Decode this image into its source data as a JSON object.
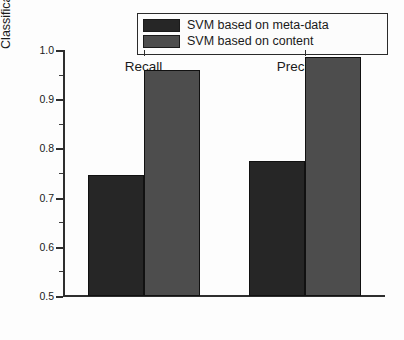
{
  "chart_data": {
    "type": "bar",
    "title": "",
    "subtitle": "",
    "xlabel": "",
    "ylabel": "Classification Accuracy",
    "categories": [
      "Recall",
      "Precision"
    ],
    "series": [
      {
        "name": "SVM based on meta-data",
        "color": "#262626",
        "values": [
          0.745,
          0.775
        ]
      },
      {
        "name": "SVM based on content",
        "color": "#4d4d4d",
        "values": [
          0.96,
          0.985
        ]
      }
    ],
    "ylim": [
      0.5,
      1.0
    ],
    "ytick_labels": [
      "0.5",
      "0.6",
      "0.7",
      "0.8",
      "0.9",
      "1.0"
    ],
    "ytick_values": [
      0.5,
      0.6,
      0.7,
      0.8,
      0.9,
      1.0
    ],
    "yminor_values": [
      0.55,
      0.65,
      0.75,
      0.85,
      0.95
    ],
    "grid": false,
    "legend_position": "top-center",
    "axis_color": "#2e2e2e",
    "background": "#fdfdfd"
  },
  "legend": {
    "entries": [
      {
        "label": "SVM based on meta-data",
        "color": "#262626"
      },
      {
        "label": "SVM based on content",
        "color": "#4d4d4d"
      }
    ]
  }
}
